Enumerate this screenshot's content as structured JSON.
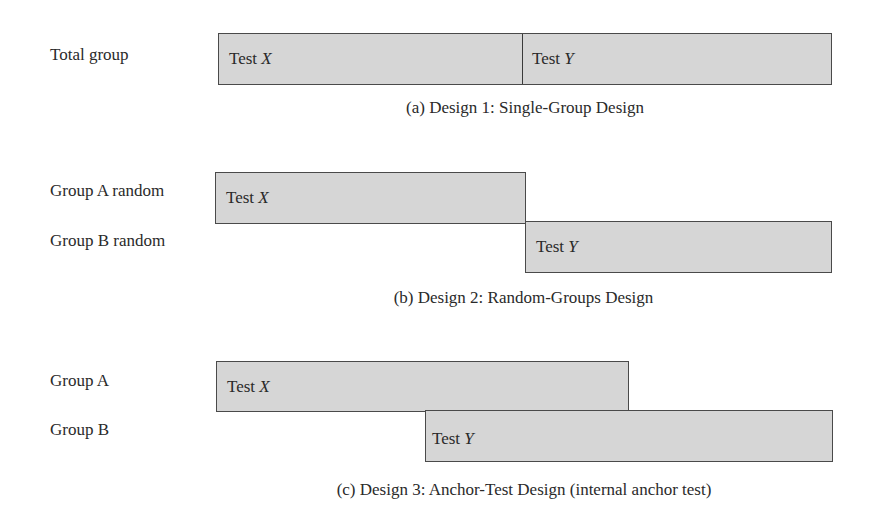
{
  "designs": [
    {
      "id": "a",
      "caption": "(a) Design 1: Single-Group Design",
      "groups": [
        {
          "label": "Total group"
        }
      ],
      "boxes": [
        {
          "test_prefix": "Test ",
          "test_var": "X",
          "group": 0
        },
        {
          "test_prefix": "Test ",
          "test_var": "Y",
          "group": 0
        }
      ]
    },
    {
      "id": "b",
      "caption": "(b) Design 2: Random-Groups Design",
      "groups": [
        {
          "label": "Group A random"
        },
        {
          "label": "Group B random"
        }
      ],
      "boxes": [
        {
          "test_prefix": "Test ",
          "test_var": "X",
          "group": 0
        },
        {
          "test_prefix": "Test ",
          "test_var": "Y",
          "group": 1
        }
      ]
    },
    {
      "id": "c",
      "caption": "(c) Design 3: Anchor-Test Design (internal anchor test)",
      "groups": [
        {
          "label": "Group A"
        },
        {
          "label": "Group B"
        }
      ],
      "boxes": [
        {
          "test_prefix": "Test ",
          "test_var": "X",
          "group": 0
        },
        {
          "test_prefix": "Test ",
          "test_var": "Y",
          "group": 1
        }
      ]
    }
  ],
  "colors": {
    "box_fill": "#d6d6d6",
    "box_border": "#4a4a4a",
    "text": "#2a2a2a"
  }
}
